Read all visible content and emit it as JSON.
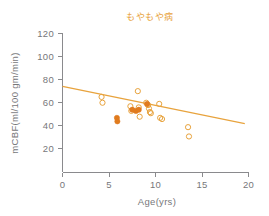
{
  "chart_data": {
    "type": "scatter",
    "title": "もやもや病",
    "xlabel": "Age(yrs)",
    "ylabel": "mCBF(ml/100 gm/min)",
    "xlim": [
      0,
      20
    ],
    "ylim": [
      0,
      120
    ],
    "xticks": [
      0,
      5,
      10,
      15,
      20
    ],
    "yticks": [
      20,
      40,
      60,
      80,
      100,
      120
    ],
    "grid": false,
    "legend": null,
    "series": [
      {
        "name": "open-markers",
        "marker": "open-circle",
        "color": "#e8a33d",
        "points": [
          {
            "x": 4.2,
            "y": 65
          },
          {
            "x": 4.3,
            "y": 60
          },
          {
            "x": 7.3,
            "y": 57
          },
          {
            "x": 7.4,
            "y": 53
          },
          {
            "x": 8.1,
            "y": 70
          },
          {
            "x": 8.2,
            "y": 56
          },
          {
            "x": 8.3,
            "y": 48
          },
          {
            "x": 9.0,
            "y": 60
          },
          {
            "x": 9.2,
            "y": 58
          },
          {
            "x": 9.3,
            "y": 55
          },
          {
            "x": 9.4,
            "y": 52
          },
          {
            "x": 9.5,
            "y": 51
          },
          {
            "x": 10.4,
            "y": 59
          },
          {
            "x": 10.5,
            "y": 47
          },
          {
            "x": 10.7,
            "y": 46
          },
          {
            "x": 13.5,
            "y": 39
          },
          {
            "x": 13.6,
            "y": 31
          }
        ]
      },
      {
        "name": "filled-markers",
        "marker": "filled-circle",
        "color": "#e07b1e",
        "points": [
          {
            "x": 5.85,
            "y": 47
          },
          {
            "x": 5.9,
            "y": 44
          },
          {
            "x": 7.5,
            "y": 54
          },
          {
            "x": 7.9,
            "y": 53
          },
          {
            "x": 8.2,
            "y": 54
          },
          {
            "x": 9.1,
            "y": 59
          }
        ]
      }
    ],
    "trendline": {
      "name": "regression-line",
      "color": "#e8a33d",
      "x0": 0,
      "y0": 74,
      "x1": 19.6,
      "y1": 42
    }
  },
  "colors": {
    "accent": "#e8a33d",
    "accent_dark": "#e07b1e",
    "axis": "#8a8a8d",
    "text": "#77777a",
    "background": "#ffffff"
  }
}
